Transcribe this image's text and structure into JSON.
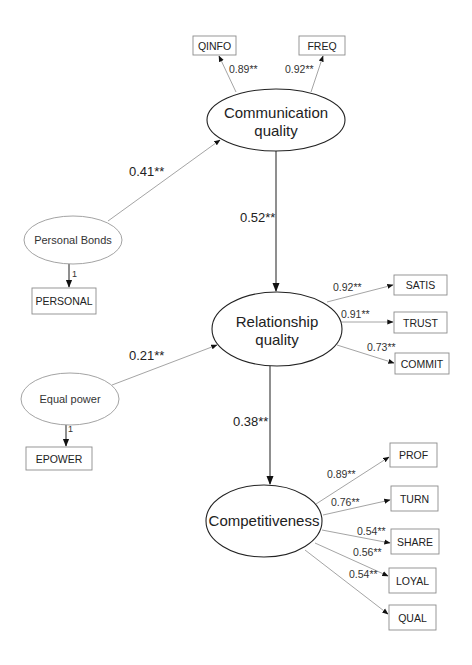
{
  "diagram": {
    "type": "structural-equation-model",
    "significance_marker": "**",
    "latents": [
      {
        "id": "comm",
        "label_lines": [
          "Communication",
          "quality"
        ],
        "kind": "major"
      },
      {
        "id": "rel",
        "label_lines": [
          "Relationship",
          "quality"
        ],
        "kind": "major"
      },
      {
        "id": "comp",
        "label_lines": [
          "Competitiveness"
        ],
        "kind": "major"
      },
      {
        "id": "pb",
        "label_lines": [
          "Personal Bonds"
        ],
        "kind": "minor"
      },
      {
        "id": "ep",
        "label_lines": [
          "Equal power"
        ],
        "kind": "minor"
      }
    ],
    "indicators": [
      {
        "id": "QINFO",
        "label": "QINFO"
      },
      {
        "id": "FREQ",
        "label": "FREQ"
      },
      {
        "id": "PERSONAL",
        "label": "PERSONAL"
      },
      {
        "id": "SATIS",
        "label": "SATIS"
      },
      {
        "id": "TRUST",
        "label": "TRUST"
      },
      {
        "id": "COMMIT",
        "label": "COMMIT"
      },
      {
        "id": "EPOWER",
        "label": "EPOWER"
      },
      {
        "id": "PROF",
        "label": "PROF"
      },
      {
        "id": "TURN",
        "label": "TURN"
      },
      {
        "id": "SHARE",
        "label": "SHARE"
      },
      {
        "id": "LOYAL",
        "label": "LOYAL"
      },
      {
        "id": "QUAL",
        "label": "QUAL"
      }
    ],
    "structural_paths": [
      {
        "from": "pb",
        "to": "comm",
        "coef": "0.41**"
      },
      {
        "from": "comm",
        "to": "rel",
        "coef": "0.52**"
      },
      {
        "from": "ep",
        "to": "rel",
        "coef": "0.21**"
      },
      {
        "from": "rel",
        "to": "comp",
        "coef": "0.38**"
      }
    ],
    "loadings": [
      {
        "from": "comm",
        "to": "QINFO",
        "coef": "0.89**"
      },
      {
        "from": "comm",
        "to": "FREQ",
        "coef": "0.92**"
      },
      {
        "from": "pb",
        "to": "PERSONAL",
        "coef": "1"
      },
      {
        "from": "rel",
        "to": "SATIS",
        "coef": "0.92**"
      },
      {
        "from": "rel",
        "to": "TRUST",
        "coef": "0.91**"
      },
      {
        "from": "rel",
        "to": "COMMIT",
        "coef": "0.73**"
      },
      {
        "from": "ep",
        "to": "EPOWER",
        "coef": "1"
      },
      {
        "from": "comp",
        "to": "PROF",
        "coef": "0.89**"
      },
      {
        "from": "comp",
        "to": "TURN",
        "coef": "0.76**"
      },
      {
        "from": "comp",
        "to": "SHARE",
        "coef": "0.54**"
      },
      {
        "from": "comp",
        "to": "LOYAL",
        "coef": "0.56**"
      },
      {
        "from": "comp",
        "to": "QUAL",
        "coef": "0.54**"
      }
    ]
  }
}
